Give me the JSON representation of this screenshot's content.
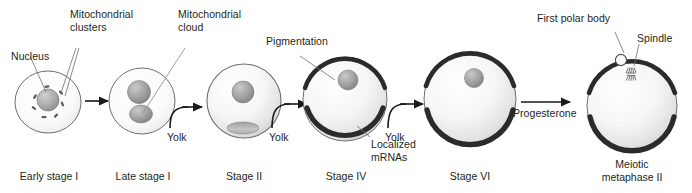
{
  "figure": {
    "background_color": "#ffffff",
    "text_color": "#231f20"
  },
  "callouts": {
    "nucleus": "Nucleus",
    "mitochondrial_clusters_line1": "Mitochondrial",
    "mitochondrial_clusters_line2": "clusters",
    "mitochondrial_cloud_line1": "Mitochondrial",
    "mitochondrial_cloud_line2": "cloud",
    "pigmentation": "Pigmentation",
    "first_polar_body": "First polar body",
    "spindle": "Spindle",
    "localized_mrnas_line1": "Localized",
    "localized_mrnas_line2": "mRNAs"
  },
  "transitions": [
    {
      "id": "t1",
      "label": "",
      "type": "straight-arrow"
    },
    {
      "id": "t2",
      "label": "Yolk",
      "type": "curved-arrow"
    },
    {
      "id": "t3",
      "label": "Yolk",
      "type": "curved-arrow"
    },
    {
      "id": "t4",
      "label": "Yolk",
      "type": "curved-arrow"
    },
    {
      "id": "t5",
      "label": "",
      "type": "straight-arrow"
    },
    {
      "id": "t6",
      "label": "Progesterone",
      "type": "straight-arrow"
    }
  ],
  "stages": [
    {
      "id": "early-stage-1",
      "name_line1": "Early stage I",
      "name_line2": ""
    },
    {
      "id": "late-stage-1",
      "name_line1": "Late stage I",
      "name_line2": ""
    },
    {
      "id": "stage-2",
      "name_line1": "Stage II",
      "name_line2": ""
    },
    {
      "id": "stage-4",
      "name_line1": "Stage IV",
      "name_line2": ""
    },
    {
      "id": "stage-6",
      "name_line1": "Stage VI",
      "name_line2": ""
    },
    {
      "id": "meiotic",
      "name_line1": "Meiotic",
      "name_line2": "metaphase II"
    }
  ],
  "colors": {
    "outline": "#4d4d4d",
    "pigment": "#2b2b2b",
    "cytoplasm_light": "#fbfbfb",
    "cytoplasm_mid": "#e6e6e6",
    "organelle_gray": "#9a9a9a",
    "leader_line": "#6e6e6e"
  }
}
